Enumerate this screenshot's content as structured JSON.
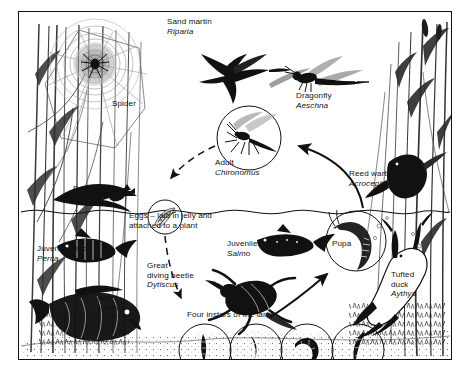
{
  "figure": {
    "type": "life-cycle-diagram",
    "border_color": "#111111",
    "background_color": "#ffffff",
    "ink_color": "#111111"
  },
  "labels": {
    "sand_martin": {
      "common": "Sand martin",
      "latin": "Riparia"
    },
    "spider": {
      "common": "Spider",
      "latin": ""
    },
    "dragonfly": {
      "common": "Dragonfly",
      "latin": "Aeschna"
    },
    "adult": {
      "common": "Adult",
      "latin": "Chironomus"
    },
    "reed_warbler": {
      "common": "Reed warbler",
      "latin": "Acrocephalus"
    },
    "bat": {
      "common": "Bat",
      "latin": "Myotis"
    },
    "eggs": {
      "common": "Eggs – laid in jelly and",
      "latin": "",
      "line2": "attached to a plant"
    },
    "juvenile_perch": {
      "common": "Juvenile perch",
      "latin": "Perca"
    },
    "juvenile_trout": {
      "common": "Juvenile trout",
      "latin": "Salmo"
    },
    "pupa": {
      "common": "Pupa",
      "latin": ""
    },
    "great_diving_beetle": {
      "common": "Great",
      "line2": "diving beetle",
      "latin": "Dytiscus"
    },
    "carp": {
      "common": "Carp",
      "latin": "Cyprinus"
    },
    "tufted_duck": {
      "common": "Tufted",
      "line2": "duck",
      "latin": "Aythya"
    },
    "instars": {
      "common": "Four instars of the larva",
      "latin": ""
    }
  },
  "cycle": {
    "stages": [
      "Eggs",
      "Four instars of the larva",
      "Pupa",
      "Adult"
    ],
    "arrows": [
      {
        "from": "Adult",
        "to": "Eggs",
        "style": "dashed"
      },
      {
        "from": "Eggs",
        "to": "Larva",
        "style": "dashed"
      },
      {
        "from": "Larva",
        "to": "Pupa",
        "style": "solid"
      },
      {
        "from": "Pupa",
        "to": "Adult",
        "style": "solid"
      }
    ]
  },
  "scene": {
    "waterline": "wavy horizontal line across the middle",
    "above_water": [
      "Sand martin",
      "Spider",
      "Dragonfly",
      "Adult Chironomus",
      "Reed warbler",
      "Bat",
      "reeds"
    ],
    "below_water": [
      "Juvenile perch",
      "Carp",
      "Juvenile trout",
      "Great diving beetle",
      "Pupa",
      "Tufted duck",
      "larval instars",
      "pond bed"
    ]
  }
}
